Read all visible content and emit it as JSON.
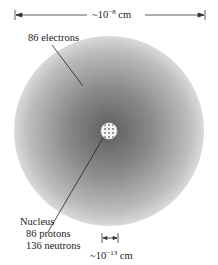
{
  "diagram": {
    "top_scale": {
      "prefix": "~10",
      "exponent": "−8",
      "unit": "cm"
    },
    "electron_label": "86 electrons",
    "nucleus": {
      "title": "Nucleus",
      "protons": "86 protons",
      "neutrons": "136 neutrons"
    },
    "nucleus_scale": {
      "prefix": "~10",
      "exponent": "−13",
      "unit": "cm"
    },
    "colors": {
      "cloud_center": "#6e6e6e",
      "cloud_edge": "#d6d6d6",
      "nucleus": "#f2f2f2",
      "lines": "#222222"
    }
  }
}
